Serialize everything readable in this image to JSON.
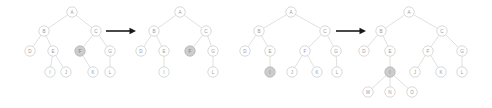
{
  "figure": {
    "background_color": "#ffffff",
    "node_fill": "#ffffff",
    "node_stroke": "#cfcfcf",
    "node_highlight_fill": "#cdcdcd",
    "edge_color": "#d8d8d8",
    "label_color": "#9a9a9a",
    "arrow_color": "#1a1a1a",
    "node_radius": 5.2
  },
  "panels": [
    {
      "id": "tree-1",
      "name": "tree-before-first-step",
      "nodes": [
        {
          "id": "n1-A",
          "label": "A",
          "x": 72,
          "y": 12,
          "highlight": false
        },
        {
          "id": "n1-B",
          "label": "B",
          "x": 44,
          "y": 31,
          "highlight": false
        },
        {
          "id": "n1-C",
          "label": "C",
          "x": 96,
          "y": 31,
          "highlight": false
        },
        {
          "id": "n1-D",
          "label": "D",
          "x": 30,
          "y": 51,
          "highlight": false
        },
        {
          "id": "n1-E",
          "label": "E",
          "x": 53,
          "y": 51,
          "highlight": false
        },
        {
          "id": "n1-F",
          "label": "F",
          "x": 80,
          "y": 51,
          "highlight": true
        },
        {
          "id": "n1-G",
          "label": "G",
          "x": 110,
          "y": 51,
          "highlight": false
        },
        {
          "id": "n1-I",
          "label": "I",
          "x": 50,
          "y": 72,
          "highlight": false
        },
        {
          "id": "n1-J",
          "label": "J",
          "x": 66,
          "y": 72,
          "highlight": false
        },
        {
          "id": "n1-K",
          "label": "K",
          "x": 93,
          "y": 72,
          "highlight": false
        },
        {
          "id": "n1-L",
          "label": "L",
          "x": 110,
          "y": 72,
          "highlight": false
        }
      ],
      "edges": [
        [
          "n1-A",
          "n1-B"
        ],
        [
          "n1-A",
          "n1-C"
        ],
        [
          "n1-B",
          "n1-D"
        ],
        [
          "n1-B",
          "n1-E"
        ],
        [
          "n1-C",
          "n1-F"
        ],
        [
          "n1-C",
          "n1-G"
        ],
        [
          "n1-E",
          "n1-I"
        ],
        [
          "n1-E",
          "n1-J"
        ],
        [
          "n1-F",
          "n1-K"
        ],
        [
          "n1-G",
          "n1-L"
        ]
      ]
    },
    {
      "id": "tree-2",
      "name": "tree-after-first-step",
      "nodes": [
        {
          "id": "n2-A",
          "label": "A",
          "x": 180,
          "y": 12,
          "highlight": false
        },
        {
          "id": "n2-B",
          "label": "B",
          "x": 154,
          "y": 31,
          "highlight": false
        },
        {
          "id": "n2-C",
          "label": "C",
          "x": 206,
          "y": 31,
          "highlight": false
        },
        {
          "id": "n2-D",
          "label": "D",
          "x": 141,
          "y": 51,
          "highlight": false
        },
        {
          "id": "n2-E",
          "label": "E",
          "x": 164,
          "y": 51,
          "highlight": false
        },
        {
          "id": "n2-F",
          "label": "F",
          "x": 190,
          "y": 51,
          "highlight": true
        },
        {
          "id": "n2-G",
          "label": "G",
          "x": 213,
          "y": 51,
          "highlight": false
        },
        {
          "id": "n2-I",
          "label": "I",
          "x": 164,
          "y": 72,
          "highlight": false
        },
        {
          "id": "n2-L",
          "label": "L",
          "x": 213,
          "y": 72,
          "highlight": false
        }
      ],
      "edges": [
        [
          "n2-A",
          "n2-B"
        ],
        [
          "n2-A",
          "n2-C"
        ],
        [
          "n2-B",
          "n2-D"
        ],
        [
          "n2-B",
          "n2-E"
        ],
        [
          "n2-C",
          "n2-F"
        ],
        [
          "n2-C",
          "n2-G"
        ],
        [
          "n2-E",
          "n2-I"
        ],
        [
          "n2-G",
          "n2-L"
        ]
      ]
    },
    {
      "id": "tree-3",
      "name": "tree-before-second-step",
      "nodes": [
        {
          "id": "n3-A",
          "label": "A",
          "x": 291,
          "y": 12,
          "highlight": false
        },
        {
          "id": "n3-B",
          "label": "B",
          "x": 259,
          "y": 31,
          "highlight": false
        },
        {
          "id": "n3-C",
          "label": "C",
          "x": 325,
          "y": 31,
          "highlight": false
        },
        {
          "id": "n3-D",
          "label": "D",
          "x": 245,
          "y": 51,
          "highlight": false
        },
        {
          "id": "n3-E",
          "label": "E",
          "x": 270,
          "y": 51,
          "highlight": false
        },
        {
          "id": "n3-F",
          "label": "F",
          "x": 305,
          "y": 51,
          "highlight": false
        },
        {
          "id": "n3-G",
          "label": "G",
          "x": 336,
          "y": 51,
          "highlight": false
        },
        {
          "id": "n3-I",
          "label": "I",
          "x": 270,
          "y": 72,
          "highlight": true
        },
        {
          "id": "n3-J",
          "label": "J",
          "x": 292,
          "y": 72,
          "highlight": false
        },
        {
          "id": "n3-K",
          "label": "K",
          "x": 317,
          "y": 72,
          "highlight": false
        },
        {
          "id": "n3-L",
          "label": "L",
          "x": 337,
          "y": 72,
          "highlight": false
        }
      ],
      "edges": [
        [
          "n3-A",
          "n3-B"
        ],
        [
          "n3-A",
          "n3-C"
        ],
        [
          "n3-B",
          "n3-D"
        ],
        [
          "n3-B",
          "n3-E"
        ],
        [
          "n3-C",
          "n3-F"
        ],
        [
          "n3-C",
          "n3-G"
        ],
        [
          "n3-E",
          "n3-I"
        ],
        [
          "n3-F",
          "n3-J"
        ],
        [
          "n3-F",
          "n3-K"
        ],
        [
          "n3-G",
          "n3-L"
        ]
      ]
    },
    {
      "id": "tree-4",
      "name": "tree-after-second-step",
      "nodes": [
        {
          "id": "n4-A",
          "label": "A",
          "x": 409,
          "y": 12,
          "highlight": false
        },
        {
          "id": "n4-B",
          "label": "B",
          "x": 381,
          "y": 31,
          "highlight": false
        },
        {
          "id": "n4-C",
          "label": "C",
          "x": 442,
          "y": 31,
          "highlight": false
        },
        {
          "id": "n4-D",
          "label": "D",
          "x": 364,
          "y": 51,
          "highlight": false
        },
        {
          "id": "n4-E",
          "label": "E",
          "x": 390,
          "y": 51,
          "highlight": false
        },
        {
          "id": "n4-F",
          "label": "F",
          "x": 428,
          "y": 51,
          "highlight": false
        },
        {
          "id": "n4-G",
          "label": "G",
          "x": 462,
          "y": 51,
          "highlight": false
        },
        {
          "id": "n4-I",
          "label": "I",
          "x": 390,
          "y": 72,
          "highlight": true
        },
        {
          "id": "n4-J",
          "label": "J",
          "x": 415,
          "y": 72,
          "highlight": false
        },
        {
          "id": "n4-K",
          "label": "K",
          "x": 441,
          "y": 72,
          "highlight": false
        },
        {
          "id": "n4-L",
          "label": "L",
          "x": 462,
          "y": 72,
          "highlight": false
        },
        {
          "id": "n4-M",
          "label": "M",
          "x": 368,
          "y": 92,
          "highlight": false
        },
        {
          "id": "n4-N",
          "label": "N",
          "x": 390,
          "y": 92,
          "highlight": false
        },
        {
          "id": "n4-O",
          "label": "O",
          "x": 412,
          "y": 92,
          "highlight": false
        }
      ],
      "edges": [
        [
          "n4-A",
          "n4-B"
        ],
        [
          "n4-A",
          "n4-C"
        ],
        [
          "n4-B",
          "n4-D"
        ],
        [
          "n4-B",
          "n4-E"
        ],
        [
          "n4-C",
          "n4-F"
        ],
        [
          "n4-C",
          "n4-G"
        ],
        [
          "n4-E",
          "n4-I"
        ],
        [
          "n4-F",
          "n4-J"
        ],
        [
          "n4-F",
          "n4-K"
        ],
        [
          "n4-G",
          "n4-L"
        ],
        [
          "n4-I",
          "n4-M"
        ],
        [
          "n4-I",
          "n4-N"
        ],
        [
          "n4-I",
          "n4-O"
        ]
      ]
    }
  ],
  "arrows": [
    {
      "id": "arrow-1",
      "name": "transformation-arrow-left",
      "x1": 106,
      "x2": 136,
      "y": 31
    },
    {
      "id": "arrow-2",
      "name": "transformation-arrow-right",
      "x1": 336,
      "x2": 366,
      "y": 31
    }
  ]
}
